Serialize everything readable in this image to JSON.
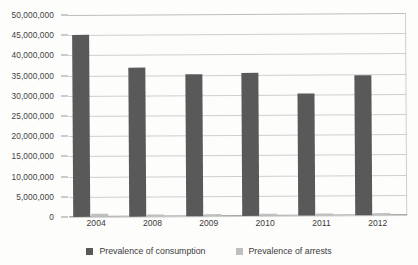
{
  "chart_data": {
    "type": "bar",
    "title": "",
    "subtitle": "",
    "xlabel": "",
    "ylabel": "",
    "categories": [
      "2004",
      "2008",
      "2009",
      "2010",
      "2011",
      "2012"
    ],
    "series": [
      {
        "name": "Prevalence of consumption",
        "color": "#595959",
        "values": [
          45000000,
          36800000,
          35200000,
          35500000,
          30200000,
          34700000
        ]
      },
      {
        "name": "Prevalence of arrests",
        "color": "#bfbfbf",
        "values": [
          700000,
          600000,
          550000,
          600000,
          500000,
          550000
        ]
      }
    ],
    "ylim": [
      0,
      50000000
    ],
    "ytick_step": 5000000,
    "ytick_labels": [
      "0",
      "5,000,000",
      "10,000,000",
      "15,000,000",
      "20,000,000",
      "25,000,000",
      "30,000,000",
      "35,000,000",
      "40,000,000",
      "45,000,000",
      "50,000,000"
    ],
    "grid": "horizontal",
    "legend_position": "bottom"
  },
  "legend": {
    "items": [
      {
        "label": "Prevalence of consumption"
      },
      {
        "label": "Prevalence of arrests"
      }
    ]
  }
}
